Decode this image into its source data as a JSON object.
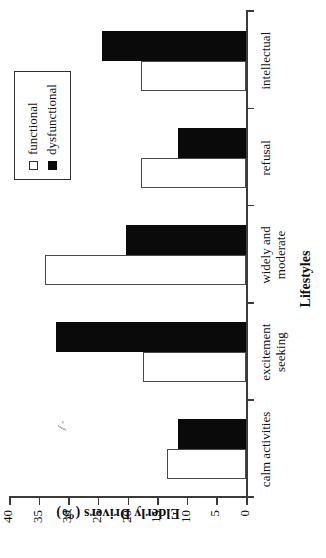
{
  "chart_data": {
    "type": "bar",
    "title": "",
    "orientation": "vertical",
    "xlabel": "Lifestyles",
    "ylabel": "Elderly Drivers (%)",
    "ylim": [
      0,
      40
    ],
    "yticks": [
      0,
      5,
      10,
      15,
      20,
      25,
      30,
      35,
      40
    ],
    "ytick_labels": [
      "0",
      "5",
      "10",
      "15",
      "20",
      "25",
      "30",
      "35",
      "40"
    ],
    "grid": false,
    "legend_position": "top-right",
    "categories": [
      "calm activities",
      "excitement seeking",
      "widely and moderate",
      "refusal",
      "intellectual"
    ],
    "category_lines": [
      [
        "calm activities"
      ],
      [
        "excitement",
        "seeking"
      ],
      [
        "widely and",
        "moderate"
      ],
      [
        "refusal"
      ],
      [
        "intellectual"
      ]
    ],
    "series": [
      {
        "name": "functional",
        "color": "#ffffff",
        "edge_color": "#4a4a4a",
        "values": [
          13.3,
          17.3,
          34.0,
          17.7,
          17.7
        ]
      },
      {
        "name": "dysfunctional",
        "color": "#0a0a0a",
        "edge_color": "#0a0a0a",
        "values": [
          11.5,
          32.0,
          20.3,
          11.5,
          24.3
        ]
      }
    ]
  },
  "legend": {
    "items": [
      {
        "label": "functional",
        "swatch": "open-square-swatch"
      },
      {
        "label": "dysfunctional",
        "swatch": "filled-square-swatch"
      }
    ]
  },
  "colors": {
    "axis": "#3a3a3a",
    "functional": "#ffffff",
    "dysfunctional": "#0a0a0a",
    "text": "#111111"
  }
}
